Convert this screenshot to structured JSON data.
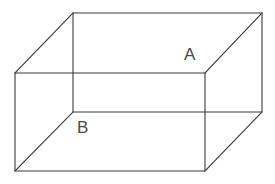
{
  "figure": {
    "type": "line-drawing",
    "background_color": "#ffffff",
    "stroke_color": "#3b3b3b",
    "stroke_width": 1.1,
    "projection": "oblique",
    "canvas": {
      "width": 275,
      "height": 184
    }
  },
  "labels": {
    "a": "A",
    "b": "B"
  },
  "label_meta": {
    "a_description": "label-a",
    "b_description": "label-b",
    "font_size": 17,
    "color": "#4a4a4a"
  },
  "geometry": {
    "front_face": {
      "name": "front-face",
      "points": "15,73 205,73 205,171 15,171"
    },
    "back_face": {
      "name": "back-face",
      "points": "73,13 262,13 262,112 73,112"
    },
    "connector_top_left": {
      "x1": 15,
      "y1": 73,
      "x2": 73,
      "y2": 13
    },
    "connector_top_right": {
      "x1": 205,
      "y1": 73,
      "x2": 262,
      "y2": 13
    },
    "connector_bottom_left": {
      "x1": 15,
      "y1": 171,
      "x2": 73,
      "y2": 112
    },
    "connector_bottom_right": {
      "x1": 205,
      "y1": 171,
      "x2": 262,
      "y2": 112
    }
  }
}
